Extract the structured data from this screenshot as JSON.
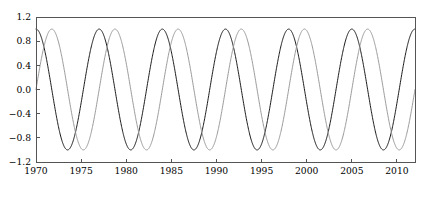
{
  "chart_data": {
    "type": "line",
    "title": "",
    "xlabel": "",
    "ylabel": "",
    "xlim": [
      1970,
      2012
    ],
    "ylim": [
      -1.2,
      1.2
    ],
    "grid": false,
    "legend": "none",
    "xticks": [
      1970,
      1975,
      1980,
      1985,
      1990,
      1995,
      2000,
      2005,
      2010
    ],
    "xtick_labels": [
      "1970",
      "1975",
      "1980",
      "1985",
      "1990",
      "1995",
      "2000",
      "2005",
      "2010"
    ],
    "yticks": [
      1.2,
      0.8,
      0.4,
      0.0,
      -0.4,
      -0.8,
      -1.2
    ],
    "ytick_labels": [
      "1.2",
      "0.8",
      "0.4",
      "0.0",
      "-0.8",
      "-0.8",
      "-1.2"
    ],
    "ytick_labels_display": [
      "1.2",
      "0.8",
      "0.4",
      "0.0",
      "−0.4",
      "−0.8",
      "−1.2"
    ],
    "series": [
      {
        "name": "cosine-wave",
        "color": "#1a1a1a",
        "linewidth": 1.0,
        "amplitude": 1.0,
        "period_years": 7.0,
        "phase_years": 0.0,
        "start_value": 1.0,
        "form": "amplitude * cos(2*pi*(x - 1970)/7.0)"
      },
      {
        "name": "sine-wave",
        "color": "#9a9a9a",
        "linewidth": 1.0,
        "amplitude": 1.0,
        "period_years": 7.0,
        "phase_years": 1.75,
        "start_value": 0.0,
        "form": "amplitude * sin(2*pi*(x - 1970)/7.0)"
      }
    ]
  },
  "figure": {
    "background": "#ffffff",
    "axes_color": "#555555",
    "text_color": "#000000"
  }
}
